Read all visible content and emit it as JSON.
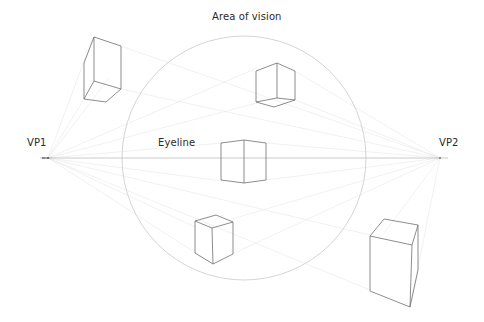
{
  "labels": {
    "title": "Area of vision",
    "eyeline": "Eyeline",
    "vp1": "VP1",
    "vp2": "VP2"
  },
  "diagram": {
    "type": "two-point perspective",
    "colors": {
      "background": "#ffffff",
      "cube_stroke": "#6a6a6a",
      "circle_stroke": "#cfcfcf",
      "guide_stroke": "#e6e6e6",
      "eyeline_stroke": "#b8b8b8",
      "text": "#2a2a2a"
    },
    "vanishing_points": [
      {
        "id": "VP1",
        "x": 48,
        "y": 158
      },
      {
        "id": "VP2",
        "x": 440,
        "y": 158
      }
    ],
    "area_of_vision": {
      "cx": 244,
      "cy": 158,
      "r": 122
    },
    "eyeline_y": 158,
    "cubes": [
      {
        "id": "top-left-box",
        "position": "above eyeline, outside circle"
      },
      {
        "id": "top-center-cube",
        "position": "above eyeline, inside circle"
      },
      {
        "id": "center-cube",
        "position": "on eyeline, inside circle"
      },
      {
        "id": "bottom-center-cube",
        "position": "below eyeline, inside circle"
      },
      {
        "id": "bottom-right-box",
        "position": "below eyeline, outside circle"
      }
    ]
  }
}
